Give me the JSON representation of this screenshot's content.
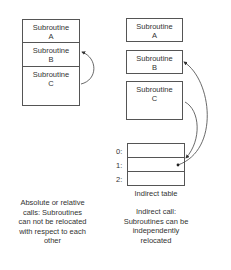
{
  "left": {
    "subroutines": [
      {
        "line1": "Subroutine",
        "line2": "A"
      },
      {
        "line1": "Subroutine",
        "line2": "B"
      },
      {
        "line1": "Subroutine",
        "line2": "C"
      }
    ],
    "caption": [
      "Absolute or relative",
      "calls: Subroutines",
      "can not be relocated",
      "with respect to each",
      "other"
    ]
  },
  "right": {
    "subroutines": [
      {
        "line1": "Subroutine",
        "line2": "A"
      },
      {
        "line1": "Subroutine",
        "line2": "B"
      },
      {
        "line1": "Subroutine",
        "line2": "C"
      }
    ],
    "table_rows": [
      "0:",
      "1:",
      "2:"
    ],
    "table_label": "Indirect table",
    "caption": [
      "Indirect call:",
      "Subroutines can be",
      "independently",
      "relocated"
    ]
  }
}
